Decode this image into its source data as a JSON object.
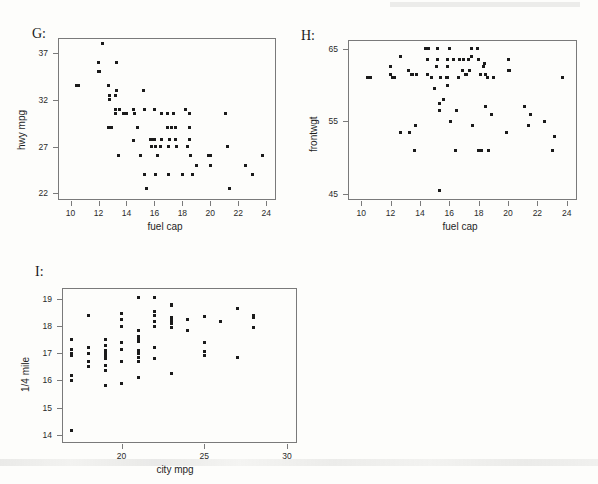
{
  "figure": {
    "background": "#fdfdfb",
    "point_color": "#1b1b1b",
    "axis_color": "#7a7a7a",
    "panel_labels": [
      "G:",
      "H:",
      "I:"
    ]
  },
  "chart_data": [
    {
      "type": "scatter",
      "panel": "G:",
      "title": "",
      "xlabel": "fuel cap",
      "ylabel": "hwy mpg",
      "xlim": [
        9.1,
        24.7
      ],
      "ylim": [
        21.3,
        38.6
      ],
      "xticks": [
        10,
        12,
        14,
        16,
        18,
        20,
        22,
        24
      ],
      "yticks": [
        22,
        27,
        32,
        37
      ],
      "grid": false,
      "legend": null,
      "x": [
        10.4,
        10.6,
        12.0,
        12.0,
        12.1,
        12.3,
        12.7,
        12.7,
        12.8,
        12.8,
        12.9,
        13.2,
        13.2,
        13.2,
        13.3,
        13.3,
        13.4,
        13.5,
        13.8,
        13.9,
        14.0,
        14.5,
        14.5,
        14.6,
        14.8,
        15.0,
        15.2,
        15.3,
        15.3,
        15.4,
        15.7,
        15.8,
        15.8,
        15.9,
        15.9,
        16.0,
        16.0,
        16.1,
        16.1,
        16.2,
        16.4,
        16.5,
        16.5,
        16.9,
        16.9,
        17.0,
        17.0,
        17.1,
        17.2,
        17.4,
        17.5,
        17.5,
        17.6,
        18.0,
        18.2,
        18.4,
        18.5,
        18.5,
        18.5,
        18.6,
        18.7,
        19.0,
        19.9,
        20.0,
        20.0,
        21.1,
        21.2,
        21.4,
        22.5,
        23.0,
        23.7
      ],
      "y": [
        33.5,
        33.5,
        36.0,
        35.0,
        35.0,
        38.0,
        33.5,
        29.0,
        32.5,
        32.0,
        29.0,
        32.5,
        31.0,
        30.5,
        36.0,
        33.0,
        26.0,
        31.0,
        30.5,
        30.5,
        30.5,
        31.0,
        27.7,
        30.5,
        29.0,
        26.0,
        33.0,
        31.0,
        24.0,
        22.5,
        27.8,
        27.8,
        27.0,
        27.8,
        27.8,
        31.0,
        27.8,
        27.0,
        24.0,
        26.0,
        27.0,
        30.5,
        27.8,
        30.5,
        29.0,
        27.0,
        24.0,
        27.8,
        29.0,
        30.5,
        29.0,
        27.8,
        27.0,
        24.0,
        31.0,
        27.0,
        30.5,
        29.0,
        27.8,
        26.0,
        24.0,
        25.0,
        26.0,
        26.0,
        25.0,
        30.5,
        27.0,
        22.5,
        25.0,
        24.0,
        26.0
      ]
    },
    {
      "type": "scatter",
      "panel": "H:",
      "title": "",
      "xlabel": "fuel cap",
      "ylabel": "frontwgt",
      "xlim": [
        9.1,
        24.7
      ],
      "ylim": [
        44.2,
        66.2
      ],
      "xticks": [
        10,
        12,
        14,
        16,
        18,
        20,
        22,
        24
      ],
      "yticks": [
        45,
        55,
        65
      ],
      "grid": false,
      "legend": null,
      "x": [
        10.4,
        10.6,
        12.0,
        12.0,
        12.1,
        12.3,
        12.7,
        12.7,
        13.2,
        13.3,
        13.4,
        13.5,
        13.6,
        13.7,
        13.8,
        14.4,
        14.5,
        14.5,
        14.6,
        14.6,
        14.8,
        15.0,
        15.1,
        15.2,
        15.2,
        15.3,
        15.3,
        15.3,
        15.4,
        15.6,
        15.8,
        15.9,
        15.9,
        15.9,
        15.9,
        16.0,
        16.1,
        16.3,
        16.4,
        16.5,
        16.6,
        16.7,
        16.9,
        17.0,
        17.1,
        17.2,
        17.2,
        17.3,
        17.4,
        17.5,
        17.5,
        17.6,
        17.9,
        18.0,
        18.0,
        18.1,
        18.2,
        18.2,
        18.3,
        18.4,
        18.5,
        18.5,
        18.6,
        18.7,
        18.9,
        19.0,
        19.9,
        20.0,
        20.0,
        20.1,
        21.1,
        21.4,
        21.5,
        22.5,
        23.0,
        23.2,
        23.7
      ],
      "y": [
        61.0,
        61.0,
        62.5,
        61.5,
        61.0,
        61.0,
        64.0,
        53.5,
        62.0,
        53.5,
        61.5,
        61.5,
        51.0,
        54.5,
        61.5,
        65.0,
        63.5,
        61.5,
        65.0,
        65.0,
        61.0,
        59.5,
        62.5,
        65.0,
        63.5,
        57.5,
        56.5,
        45.5,
        61.0,
        58.0,
        61.0,
        63.5,
        62.5,
        61.0,
        60.0,
        65.0,
        55.0,
        63.5,
        51.0,
        56.5,
        61.0,
        63.5,
        62.0,
        63.5,
        61.5,
        61.5,
        61.5,
        63.5,
        62.0,
        65.0,
        64.0,
        54.5,
        65.0,
        63.5,
        51.0,
        61.5,
        51.0,
        51.0,
        62.5,
        63.0,
        61.5,
        57.0,
        61.0,
        51.0,
        56.0,
        61.0,
        53.5,
        63.5,
        62.0,
        62.0,
        57.0,
        54.5,
        56.0,
        55.0,
        51.0,
        53.0,
        61.0
      ]
    },
    {
      "type": "scatter",
      "panel": "I:",
      "title": "",
      "xlabel": "city mpg",
      "ylabel": "1/4 mile",
      "xlim": [
        16.4,
        30.6
      ],
      "ylim": [
        13.7,
        19.4
      ],
      "xticks": [
        20,
        25,
        30
      ],
      "yticks": [
        14,
        15,
        16,
        17,
        18,
        19
      ],
      "grid": false,
      "legend": null,
      "x": [
        17.0,
        17.0,
        17.0,
        17.0,
        17.0,
        17.0,
        17.0,
        18.0,
        18.0,
        18.0,
        18.0,
        18.0,
        19.0,
        19.0,
        19.0,
        19.0,
        19.0,
        19.0,
        19.0,
        19.0,
        19.0,
        20.0,
        20.0,
        20.0,
        20.0,
        20.0,
        20.0,
        20.0,
        21.0,
        21.0,
        21.0,
        21.0,
        21.0,
        21.0,
        21.0,
        21.0,
        21.0,
        21.0,
        22.0,
        22.0,
        22.0,
        22.0,
        22.0,
        22.0,
        22.0,
        23.0,
        23.0,
        23.0,
        23.0,
        23.0,
        23.0,
        23.0,
        24.0,
        24.0,
        25.0,
        25.0,
        25.0,
        25.0,
        26.0,
        27.0,
        27.0,
        28.0,
        28.0,
        28.0
      ],
      "y": [
        17.5,
        17.15,
        17.0,
        16.9,
        16.2,
        16.0,
        14.15,
        18.4,
        17.2,
        17.0,
        16.7,
        16.5,
        15.8,
        17.5,
        17.3,
        17.1,
        17.0,
        16.9,
        16.8,
        16.55,
        16.35,
        18.45,
        18.25,
        18.0,
        17.4,
        17.15,
        16.7,
        15.9,
        19.05,
        17.85,
        17.6,
        17.55,
        17.45,
        17.1,
        17.0,
        16.85,
        16.7,
        16.1,
        19.05,
        18.55,
        18.4,
        18.15,
        18.0,
        17.2,
        16.8,
        18.8,
        18.75,
        18.3,
        18.2,
        18.1,
        17.95,
        16.25,
        18.25,
        17.85,
        18.35,
        17.4,
        17.05,
        16.9,
        18.15,
        18.65,
        16.85,
        18.4,
        18.3,
        17.95
      ]
    }
  ]
}
